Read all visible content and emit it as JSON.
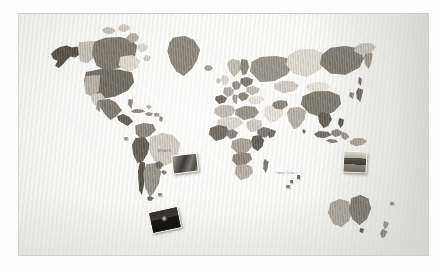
{
  "scene": {
    "title": "Wooden world map wall decoration",
    "subject": "multi-layer engraved wooden world map mounted on striped wallpaper",
    "photo_border_color": "#fefefe",
    "wall_color": "#f9f9f8",
    "wall_pattern": "fine vertical stripe wallpaper"
  },
  "map": {
    "name": "world-map",
    "style": "layered engraved wood, one piece per country",
    "tone_palette": [
      "#4f4b46",
      "#5f5a54",
      "#6e6962",
      "#7c776f",
      "#8a857c",
      "#97928a",
      "#a6a199",
      "#b4afa7",
      "#c3beb6",
      "#d2cdc5",
      "#dedad3",
      "#e8e4de"
    ],
    "engraved_labels": [
      {
        "text": "Canada",
        "region": "north-america"
      },
      {
        "text": "USA",
        "region": "north-america"
      },
      {
        "text": "BRAZIL",
        "region": "south-america"
      }
    ],
    "ocean_labels": [
      {
        "text": "Indian Ocean",
        "region": "indian-ocean"
      }
    ],
    "continents": [
      "North America",
      "South America",
      "Greenland",
      "Europe",
      "Africa",
      "Asia",
      "Russia",
      "Australia",
      "New Zealand"
    ]
  },
  "pinned_photos": [
    {
      "name": "photo-brazil",
      "location": "Atlantic off Brazil",
      "description": "small colour snapshot"
    },
    {
      "name": "photo-patagonia",
      "location": "southern South America",
      "description": "dark landscape snapshot with bright sun"
    },
    {
      "name": "photo-southeast-asia",
      "location": "Southeast Asia / Philippines",
      "description": "small landscape snapshot"
    }
  ]
}
